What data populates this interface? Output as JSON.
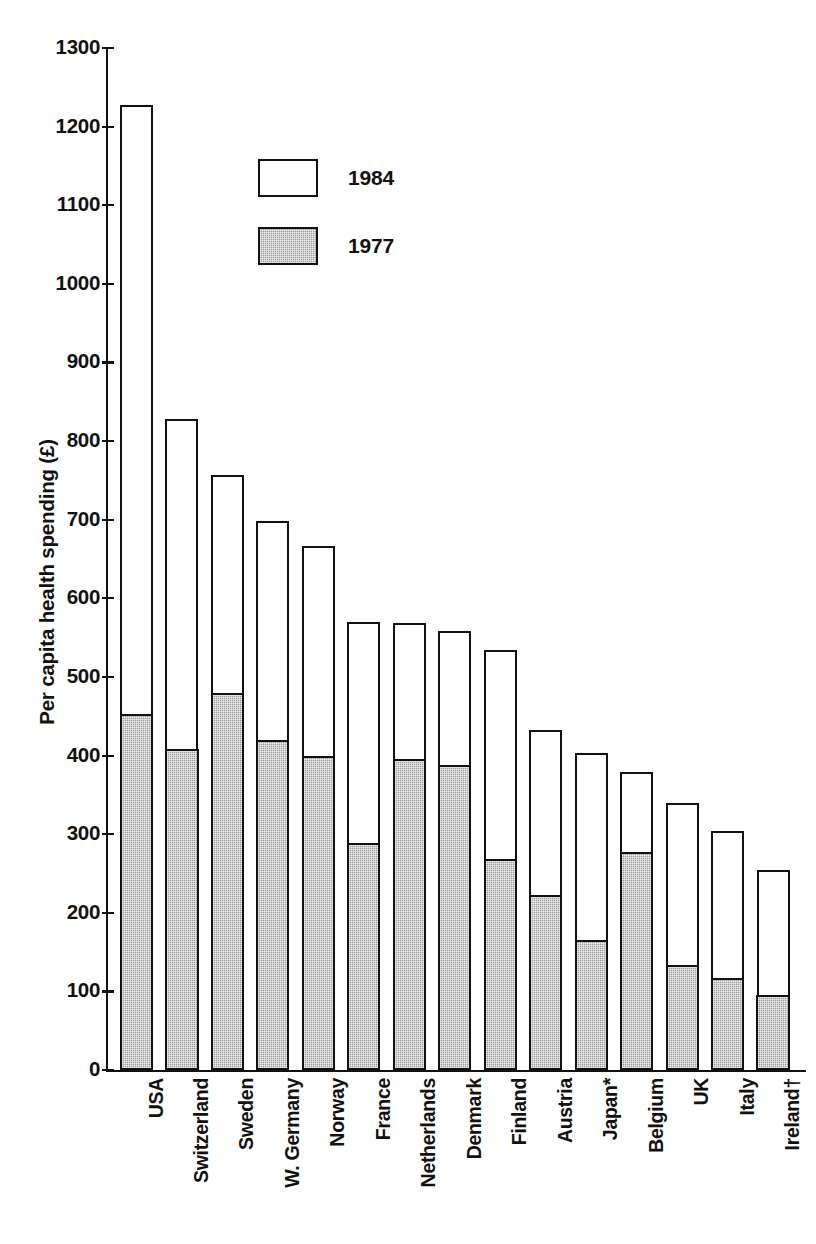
{
  "chart_data": {
    "type": "bar",
    "subtype": "stacked-overlay",
    "title": "",
    "xlabel": "",
    "ylabel": "Per capita health spending (£)",
    "ylim": [
      0,
      1300
    ],
    "ytick_step": 100,
    "ytick_labels": [
      "0",
      "100",
      "200",
      "300",
      "400",
      "500",
      "600",
      "700",
      "800",
      "900",
      "1000",
      "1100",
      "1200",
      "1300"
    ],
    "grid": false,
    "legend_position": "upper-center-left",
    "categories": [
      "USA",
      "Switzerland",
      "Sweden",
      "W. Germany",
      "Norway",
      "France",
      "Netherlands",
      "Denmark",
      "Finland",
      "Austria",
      "Japan*",
      "Belgium",
      "UK",
      "Italy",
      "Ireland†"
    ],
    "series": [
      {
        "name": "1984",
        "values": [
          1228,
          828,
          757,
          698,
          667,
          570,
          568,
          559,
          534,
          432,
          403,
          379,
          340,
          304,
          254
        ]
      },
      {
        "name": "1977",
        "values": [
          453,
          408,
          480,
          420,
          399,
          289,
          396,
          388,
          268,
          223,
          165,
          278,
          134,
          117,
          95
        ]
      }
    ]
  },
  "legend": {
    "entries": [
      {
        "label": "1984",
        "style": "white",
        "color": "#ffffff"
      },
      {
        "label": "1977",
        "style": "shaded",
        "color": "#9b9b9b"
      }
    ]
  },
  "axis": {
    "y_title": "Per capita health spending (£)",
    "currency_symbol": "£"
  },
  "footnote": {
    "text": ""
  }
}
